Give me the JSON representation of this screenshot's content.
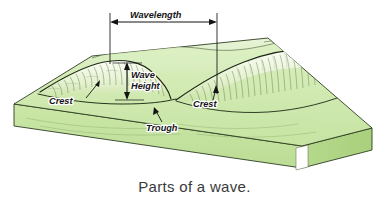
{
  "figure": {
    "title_caption": "Parts of a wave.",
    "colors": {
      "slab_top": "#cfe8ae",
      "slab_front": "#c3e29c",
      "slab_side": "#b7da8d",
      "slab_outline": "#2e3d22",
      "wave_line": "#1d2a16",
      "annotation": "#141414",
      "caption_text": "#3a3a3a",
      "background": "#ffffff",
      "wave_hatch": "#4f6b3c",
      "foam_highlight": "#f2f8e8"
    },
    "annotations": {
      "wavelength": {
        "label": "Wavelength",
        "type": "horizontal-double-arrow",
        "x_start": 110,
        "x_end": 217,
        "y": 22,
        "drop_line_left_y_end": 62,
        "drop_line_right_y_end": 92
      },
      "wave_height": {
        "label_line_1": "Wave",
        "label_line_2": "Height",
        "type": "vertical-double-arrow",
        "x": 127,
        "y_top": 62,
        "y_bottom": 100,
        "text_x": 131,
        "text_y_1": 76,
        "text_y_2": 87
      },
      "crest_left": {
        "label": "Crest",
        "text_x": 49,
        "text_y": 103,
        "leader_from_x": 86,
        "leader_from_y": 98,
        "leader_to_x": 99,
        "leader_to_y": 81
      },
      "crest_right": {
        "label": "Crest",
        "text_x": 193,
        "text_y": 106,
        "leader_from_x": 213,
        "leader_from_y": 99,
        "leader_to_x": 216,
        "leader_to_y": 87
      },
      "trough": {
        "label": "Trough",
        "text_x": 146,
        "text_y": 130,
        "leader_from_x": 162,
        "leader_from_y": 122,
        "leader_to_x": 155,
        "leader_to_y": 110
      }
    },
    "parts_listed": [
      "Wavelength",
      "Wave Height",
      "Crest",
      "Trough"
    ]
  }
}
